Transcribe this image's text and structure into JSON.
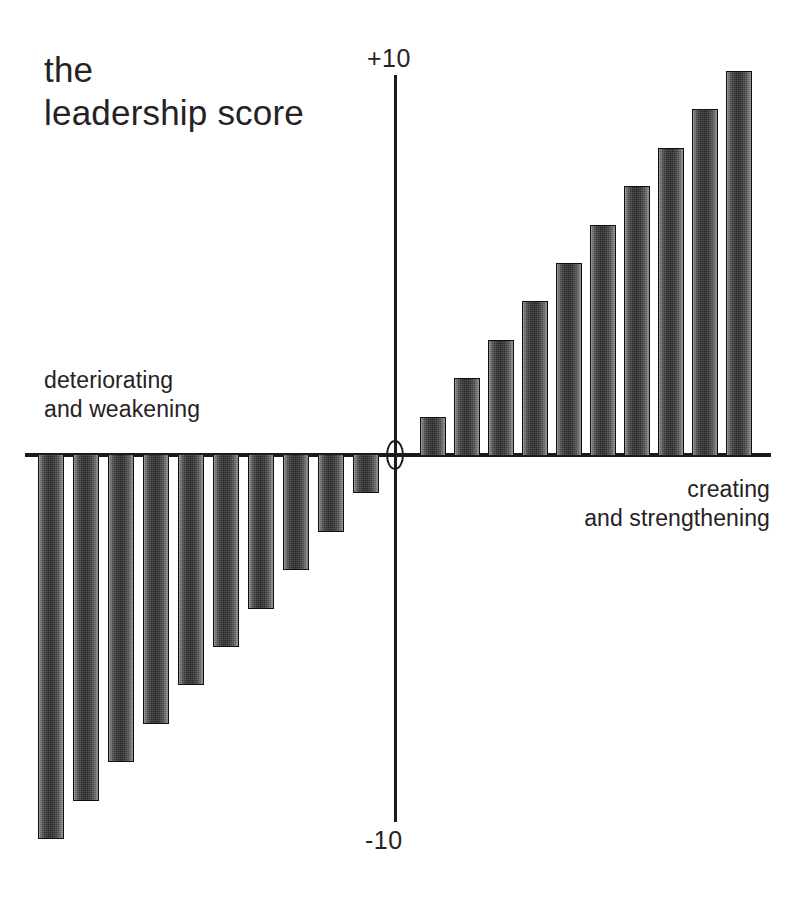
{
  "chart_data": {
    "type": "bar",
    "title": "the\nleadership score",
    "xlabel": "",
    "ylabel": "",
    "ylim": [
      -10,
      10
    ],
    "grid": false,
    "legend": null,
    "orientation": "vertical",
    "axis_ticks": {
      "top": "+10",
      "origin": "0",
      "bottom": "-10"
    },
    "annotations": {
      "left": "deteriorating\nand weakening",
      "right": "creating\nand strengthening"
    },
    "categories": [
      "-10",
      "-9",
      "-8",
      "-7",
      "-6",
      "-5",
      "-4",
      "-3",
      "-2",
      "-1",
      "+1",
      "+2",
      "+3",
      "+4",
      "+5",
      "+6",
      "+7",
      "+8",
      "+9",
      "+10"
    ],
    "values": [
      -10,
      -9,
      -8,
      -7,
      -6,
      -5,
      -4,
      -3,
      -2,
      -1,
      1,
      2,
      3,
      4,
      5,
      6,
      7,
      8,
      9,
      10
    ],
    "negative_values": [
      -10,
      -9,
      -8,
      -7,
      -6,
      -5,
      -4,
      -3,
      -2,
      -1
    ],
    "positive_values": [
      1,
      2,
      3,
      4,
      5,
      6,
      7,
      8,
      9,
      10
    ],
    "bar_color": "#2b2829",
    "background_color": "#ffffff",
    "axis_color": "#1d1a1b"
  },
  "geometry": {
    "axis": {
      "x_left": 25,
      "x_right": 771,
      "y_baseline": 455,
      "y_top": 75,
      "y_bottom": 822,
      "x_center": 395
    },
    "bar_width": 26,
    "negative_pitch": 35,
    "negative_first_x": 38,
    "positive_pitch": 34,
    "positive_first_x": 420,
    "unit_px": 38.4
  }
}
